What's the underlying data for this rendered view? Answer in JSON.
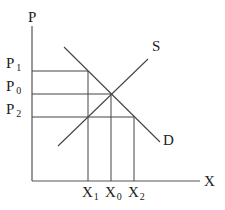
{
  "diagram": {
    "type": "supply-demand",
    "axes": {
      "y_label": "P",
      "x_label": "X"
    },
    "curves": [
      {
        "name": "S",
        "label": "S"
      },
      {
        "name": "D",
        "label": "D"
      }
    ],
    "price_levels": [
      {
        "base": "P",
        "sub": "1"
      },
      {
        "base": "P",
        "sub": "0"
      },
      {
        "base": "P",
        "sub": "2"
      }
    ],
    "quantity_levels": [
      {
        "base": "X",
        "sub": "1"
      },
      {
        "base": "X",
        "sub": "0"
      },
      {
        "base": "X",
        "sub": "2"
      }
    ],
    "colors": {
      "line": "#444444",
      "text": "#222222",
      "background": "#ffffff"
    }
  }
}
